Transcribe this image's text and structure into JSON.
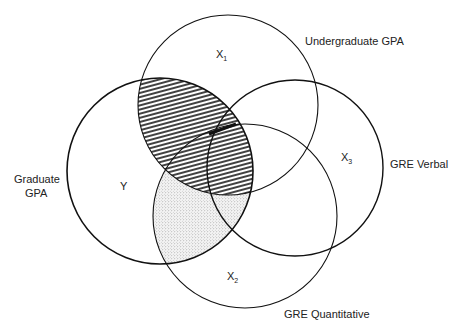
{
  "diagram": {
    "type": "venn",
    "circles": [
      {
        "id": "X1",
        "variable": "X",
        "subscript": "1",
        "label": "Undergraduate GPA",
        "cx": 228,
        "cy": 105,
        "r": 90
      },
      {
        "id": "Y",
        "variable": "Y",
        "subscript": "",
        "label_line1": "Graduate",
        "label_line2": "GPA",
        "cx": 160,
        "cy": 171,
        "r": 93
      },
      {
        "id": "X3",
        "variable": "X",
        "subscript": "3",
        "label": "GRE Verbal",
        "cx": 295,
        "cy": 168,
        "r": 88
      },
      {
        "id": "X2",
        "variable": "X",
        "subscript": "2",
        "label": "GRE Quantitative",
        "cx": 245,
        "cy": 216,
        "r": 92
      }
    ],
    "regions": [
      {
        "name": "hatched",
        "description": "Y ∩ X1",
        "fill": "diagonal hatching"
      },
      {
        "name": "stippled",
        "description": "Y ∩ X2 outside X1",
        "fill": "dotted stipple"
      }
    ]
  }
}
